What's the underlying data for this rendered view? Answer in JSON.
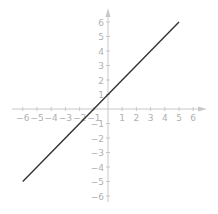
{
  "chart_data": {
    "type": "line",
    "title": "",
    "xlabel": "",
    "ylabel": "",
    "xlim": [
      -6,
      6
    ],
    "ylim": [
      -6,
      6
    ],
    "x_ticks": [
      -6,
      -5,
      -4,
      -3,
      -2,
      -1,
      1,
      2,
      3,
      4,
      5,
      6
    ],
    "y_ticks": [
      -6,
      -5,
      -4,
      -3,
      -2,
      -1,
      1,
      2,
      3,
      4,
      5,
      6
    ],
    "x_tick_labels": [
      "−6",
      "−5",
      "−4",
      "−3",
      "−2",
      "−1",
      "1",
      "2",
      "3",
      "4",
      "5",
      "6"
    ],
    "y_tick_labels": [
      "−6",
      "−5",
      "−4",
      "−3",
      "−2",
      "−1",
      "1",
      "2",
      "3",
      "4",
      "5",
      "6"
    ],
    "grid": false,
    "equation": "y = x + 1",
    "series": [
      {
        "name": "y = x + 1",
        "x": [
          -6,
          5
        ],
        "y": [
          -5,
          6
        ],
        "color": "#333333"
      }
    ],
    "axis_color": "#c8c8c8",
    "label_color": "#b0b0b0"
  }
}
